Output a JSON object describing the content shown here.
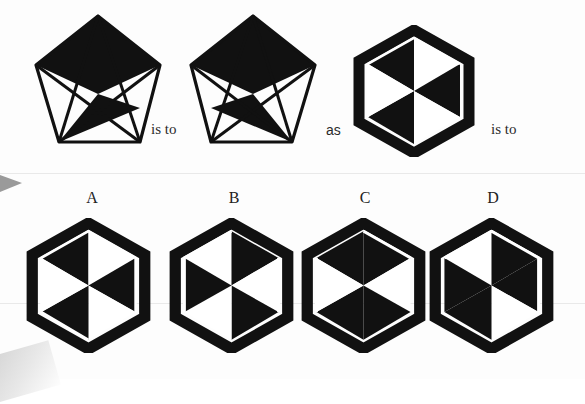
{
  "puzzle": {
    "type": "visual-analogy-matrix",
    "prompt_row": {
      "relation_1": "is to",
      "relation_2": "as",
      "relation_3": "is to"
    },
    "option_letters": [
      "A",
      "B",
      "C",
      "D"
    ],
    "colors": {
      "ink": "#111111",
      "paper": "#fdfdfd",
      "marker": "#9a9a9a",
      "scanline": "#e9e9e9"
    },
    "figures": [
      {
        "id": "prompt-1",
        "shape": "pentagon",
        "description": "Pentagon with internal star chords; upper-left and upper-right outer triangles filled black, central apex triangle white, lower-left inner triangle filled black",
        "filled_regions": [
          "upper-left",
          "upper-right",
          "lower-center-left"
        ],
        "white_regions": [
          "apex-center",
          "lower-right",
          "bottom"
        ]
      },
      {
        "id": "prompt-2",
        "shape": "pentagon",
        "description": "Mirror image of prompt-1: upper-left and upper-right outer triangles filled black, central apex triangle white, lower-right inner triangle filled black",
        "filled_regions": [
          "upper-left",
          "upper-right",
          "lower-center-right"
        ],
        "white_regions": [
          "apex-center",
          "lower-left",
          "bottom"
        ]
      },
      {
        "id": "prompt-3",
        "shape": "hexagon",
        "description": "Hexagon split into six triangles by three main diagonals; thick black border ring; top-left, right-upper, bottom-left wedges black, remaining wedges white",
        "filled_wedges": [
          0,
          2,
          4
        ],
        "white_wedges": [
          1,
          3,
          5
        ]
      }
    ],
    "options": [
      {
        "letter": "A",
        "shape": "hexagon",
        "filled_wedges": [
          0,
          2,
          4
        ],
        "white_wedges": [
          1,
          3,
          5
        ],
        "description": "Hexagon, alternating wedges black starting top-left; black ring border"
      },
      {
        "letter": "B",
        "shape": "hexagon",
        "filled_wedges": [
          1,
          3,
          5
        ],
        "white_wedges": [
          0,
          2,
          4
        ],
        "description": "Hexagon, alternating wedges black starting top-right; black ring border"
      },
      {
        "letter": "C",
        "shape": "hexagon",
        "filled_wedges": [
          0,
          1,
          3,
          4
        ],
        "white_wedges": [
          2,
          5
        ],
        "description": "Hexagon mirrored; left-facing white arrow wedges"
      },
      {
        "letter": "D",
        "shape": "hexagon",
        "filled_wedges": [
          1,
          2,
          4,
          5
        ],
        "white_wedges": [
          0,
          3
        ],
        "description": "Hexagon with white wedges at upper-left and lower-right; black ring border"
      }
    ]
  }
}
